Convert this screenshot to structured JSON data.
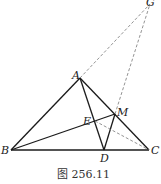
{
  "caption": "图 256.11",
  "points": {
    "A": {
      "label": "A",
      "x": 80,
      "y": 78
    },
    "B": {
      "label": "B",
      "x": 11,
      "y": 150
    },
    "C": {
      "label": "C",
      "x": 149,
      "y": 150
    },
    "D": {
      "label": "D",
      "x": 104,
      "y": 150
    },
    "M": {
      "label": "M",
      "x": 115,
      "y": 114
    },
    "E": {
      "label": "E",
      "x": 95,
      "y": 121
    },
    "G": {
      "label": "G",
      "x": 150,
      "y": 1
    }
  },
  "colors": {
    "solid": "#1a1a1a",
    "dashed": "#777777"
  }
}
